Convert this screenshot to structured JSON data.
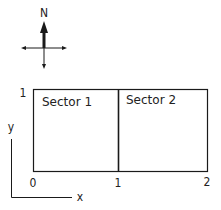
{
  "compass": {
    "north_label": "N"
  },
  "diagram": {
    "sectors": [
      {
        "label": "Sector 1",
        "x_range": [
          0,
          1
        ],
        "y_range": [
          0,
          1
        ]
      },
      {
        "label": "Sector 2",
        "x_range": [
          1,
          2
        ],
        "y_range": [
          0,
          1
        ]
      }
    ],
    "tick_labels": {
      "y_top": "1",
      "x_origin": "0",
      "x_mid": "1",
      "x_end": "2"
    },
    "axes": {
      "x_label": "x",
      "y_label": "y"
    },
    "colors": {
      "line": "#1a1a1a",
      "background": "#ffffff"
    }
  }
}
